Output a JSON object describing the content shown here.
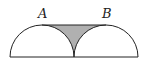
{
  "diagram": {
    "labels": {
      "a": "A",
      "b": "B"
    },
    "colors": {
      "stroke": "#222222",
      "shade": "#b0b0b0",
      "background": "#ffffff"
    },
    "shapes": [
      {
        "type": "semicircle",
        "center": [
          42,
          57
        ],
        "radius": 32
      },
      {
        "type": "semicircle",
        "center": [
          106,
          57
        ],
        "radius": 32
      },
      {
        "type": "segment",
        "from": "A",
        "to": "B"
      },
      {
        "type": "shaded-region",
        "between": "segment AB and the two arcs"
      }
    ]
  }
}
